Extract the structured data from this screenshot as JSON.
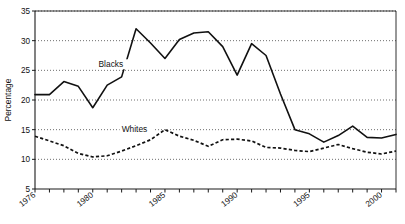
{
  "chart_data": {
    "type": "line",
    "title": "",
    "xlabel": "",
    "ylabel": "Percentage",
    "xlim": [
      1976,
      2001
    ],
    "ylim": [
      5,
      35
    ],
    "yticks": [
      5,
      10,
      15,
      20,
      25,
      30,
      35
    ],
    "ytick_labels": [
      "5",
      "10",
      "15",
      "20",
      "25",
      "30",
      "35"
    ],
    "xticks": [
      1976,
      1977,
      1978,
      1979,
      1980,
      1981,
      1982,
      1983,
      1984,
      1985,
      1986,
      1987,
      1988,
      1989,
      1990,
      1991,
      1992,
      1993,
      1994,
      1995,
      1996,
      1997,
      1998,
      1999,
      2000,
      2001
    ],
    "xtick_labels_shown": [
      "1976",
      "1980",
      "1985",
      "1990",
      "1995",
      "2000"
    ],
    "xtick_labels_shown_at": [
      1976,
      1980,
      1985,
      1990,
      1995,
      2000
    ],
    "grid": true,
    "grid_axis": "y",
    "legend_position": "inline-annotation",
    "x": [
      1976,
      1977,
      1978,
      1979,
      1980,
      1981,
      1982,
      1983,
      1984,
      1985,
      1986,
      1987,
      1988,
      1989,
      1990,
      1991,
      1992,
      1993,
      1994,
      1995,
      1996,
      1997,
      1998,
      1999,
      2000,
      2001
    ],
    "series": [
      {
        "name": "Blacks",
        "style": "solid",
        "label_x": 1980.4,
        "label_y": 25.6,
        "values": [
          20.9,
          20.9,
          23.1,
          22.3,
          18.7,
          22.5,
          23.9,
          32.0,
          29.6,
          27.0,
          30.2,
          31.3,
          31.5,
          29.0,
          24.2,
          29.5,
          27.5,
          21.0,
          15.0,
          14.3,
          12.9,
          14.0,
          15.6,
          13.7,
          13.6,
          14.2
        ],
        "values_note": "percentage, read from y-axis gridlines"
      },
      {
        "name": "Whites",
        "style": "dashed",
        "label_x": 1982.0,
        "label_y": 14.6,
        "values": [
          13.9,
          13.1,
          12.3,
          11.0,
          10.4,
          10.6,
          11.4,
          12.3,
          13.3,
          15.0,
          13.9,
          13.2,
          12.2,
          13.3,
          13.4,
          13.1,
          12.0,
          11.9,
          11.5,
          11.3,
          11.9,
          12.5,
          11.8,
          11.2,
          10.9,
          11.4
        ],
        "values_note": "percentage, read from y-axis gridlines"
      }
    ]
  },
  "axes": {
    "y_title": "Percentage"
  }
}
